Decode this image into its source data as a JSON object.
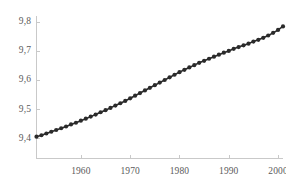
{
  "chart_data": {
    "type": "line",
    "title": "",
    "subtitle": "",
    "xlabel": "",
    "ylabel": "",
    "xlim": [
      1951,
      2001
    ],
    "ylim": [
      9.33,
      9.82
    ],
    "grid": false,
    "legend": null,
    "marker": "filled-circle",
    "line_color": "#2b2b2b",
    "marker_color": "#2b2b2b",
    "axis_color": "#c9c9c9",
    "tick_text_color": "#5a5a5a",
    "xticks": [
      1960,
      1970,
      1980,
      1990,
      2000
    ],
    "xtick_labels": [
      "1960",
      "1970",
      "1980",
      "1990",
      "2000"
    ],
    "yticks": [
      9.4,
      9.5,
      9.6,
      9.7,
      9.8
    ],
    "ytick_labels": [
      "9,4",
      "9,5",
      "9,6",
      "9,7",
      "9,8"
    ],
    "series": [
      {
        "name": "series-1",
        "x": [
          1951,
          1952,
          1953,
          1954,
          1955,
          1956,
          1957,
          1958,
          1959,
          1960,
          1961,
          1962,
          1963,
          1964,
          1965,
          1966,
          1967,
          1968,
          1969,
          1970,
          1971,
          1972,
          1973,
          1974,
          1975,
          1976,
          1977,
          1978,
          1979,
          1980,
          1981,
          1982,
          1983,
          1984,
          1985,
          1986,
          1987,
          1988,
          1989,
          1990,
          1991,
          1992,
          1993,
          1994,
          1995,
          1996,
          1997,
          1998,
          1999,
          2000,
          2001
        ],
        "values": [
          9.405,
          9.41,
          9.416,
          9.422,
          9.428,
          9.434,
          9.44,
          9.447,
          9.453,
          9.46,
          9.467,
          9.474,
          9.481,
          9.489,
          9.496,
          9.504,
          9.512,
          9.52,
          9.528,
          9.537,
          9.546,
          9.555,
          9.564,
          9.573,
          9.582,
          9.591,
          9.6,
          9.609,
          9.618,
          9.627,
          9.635,
          9.643,
          9.651,
          9.659,
          9.666,
          9.673,
          9.68,
          9.687,
          9.694,
          9.7,
          9.707,
          9.713,
          9.719,
          9.725,
          9.732,
          9.738,
          9.745,
          9.753,
          9.762,
          9.772,
          9.784
        ]
      }
    ]
  },
  "axes": {
    "x_tick_labels": [
      "1960",
      "1970",
      "1980",
      "1990",
      "2000"
    ],
    "y_tick_labels": [
      "9,4",
      "9,5",
      "9,6",
      "9,7",
      "9,8"
    ]
  }
}
